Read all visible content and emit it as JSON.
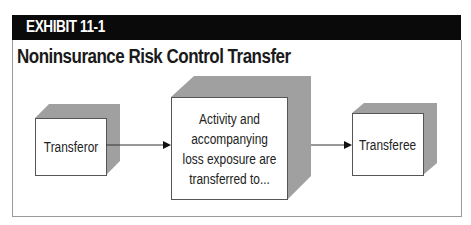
{
  "exhibit": {
    "label": "EXHIBIT 11-1"
  },
  "title": "Noninsurance Risk Control Transfer",
  "diagram": {
    "nodes": [
      {
        "id": "transferor",
        "label": "Transferor"
      },
      {
        "id": "activity",
        "label": "Activity and accompanying loss exposure are transferred to..."
      },
      {
        "id": "transferee",
        "label": "Transferee"
      }
    ],
    "edges": [
      {
        "from": "transferor",
        "to": "activity"
      },
      {
        "from": "activity",
        "to": "transferee"
      }
    ]
  },
  "colors": {
    "header_bg": "#0a0a0a",
    "box_shade": "#9e9e9e",
    "box_face": "#ffffff",
    "frame": "#9a9a9a"
  }
}
